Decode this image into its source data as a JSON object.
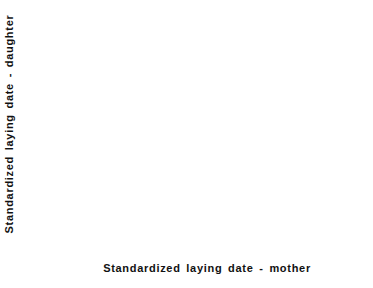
{
  "chart_data": {
    "type": "scatter",
    "title": "",
    "xlabel": "Standardized laying date - mother",
    "ylabel": "Standardized laying date - daughter",
    "xlim": [
      -8,
      16
    ],
    "ylim": [
      -8,
      16
    ],
    "grid": false,
    "x_ticks": [
      -8,
      -4,
      0,
      4,
      8,
      12,
      16
    ],
    "x_tick_labels": [
      "- 8",
      "- 4",
      "0",
      "4",
      "8",
      "12",
      "16"
    ],
    "y_ticks": [
      16,
      12,
      8,
      4,
      0,
      -4,
      -8
    ],
    "y_tick_labels": [
      "16",
      "12",
      "8",
      "4",
      "0",
      "- 4",
      "- 8"
    ],
    "points": [
      [
        5.9,
        14.4
      ],
      [
        4.4,
        13.3
      ],
      [
        4.3,
        10.1
      ],
      [
        5.0,
        8.5
      ],
      [
        -2.0,
        8.1
      ],
      [
        -2.0,
        6.0
      ],
      [
        -2.1,
        5.4
      ],
      [
        -3.1,
        4.5
      ],
      [
        5.9,
        5.6
      ],
      [
        1.8,
        4.4
      ],
      [
        7.9,
        4.4
      ],
      [
        -1.2,
        2.9
      ],
      [
        6.8,
        2.7
      ],
      [
        -4.0,
        2.4
      ],
      [
        -3.4,
        1.7
      ],
      [
        0.8,
        0.8
      ],
      [
        1.1,
        -0.7
      ],
      [
        5.4,
        -0.7
      ],
      [
        -4.3,
        -1.2
      ],
      [
        -3.6,
        -1.6
      ],
      [
        -2.9,
        -1.5
      ],
      [
        -2.9,
        -2.0
      ],
      [
        -1.1,
        -1.1
      ],
      [
        -3.9,
        -3.0
      ],
      [
        -3.1,
        -3.1
      ],
      [
        0.8,
        -2.9
      ],
      [
        2.0,
        -3.0
      ],
      [
        -3.3,
        -3.8
      ],
      [
        -3.4,
        -5.1
      ],
      [
        -2.1,
        -5.0
      ],
      [
        0.9,
        -5.1
      ],
      [
        -3.5,
        -5.9
      ],
      [
        -3.1,
        -6.5
      ]
    ],
    "regression_line": {
      "x1": -4.3,
      "y1": -1.9,
      "x2": 7.9,
      "y2": 7.4
    }
  },
  "colors": {
    "ink": "#111111",
    "frame_secondary": "#a8a8a8",
    "background": "#ffffff"
  }
}
